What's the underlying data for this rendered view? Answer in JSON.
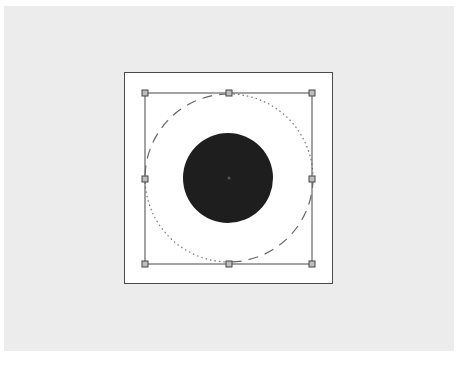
{
  "canvas": {
    "background_color": "#ececec",
    "page_border_color": "#4a4a4a"
  },
  "shapes": {
    "outer_circle": {
      "cx": 229,
      "cy": 178,
      "r": 84,
      "stroke": "#666666",
      "style": "dashed/dotted"
    },
    "filled_circle": {
      "cx": 228,
      "cy": 178,
      "r": 45,
      "fill": "#1e1e1e"
    }
  },
  "selection": {
    "x": 145,
    "y": 93,
    "width": 167,
    "height": 171,
    "stroke": "#666666",
    "handles": [
      "top-left",
      "top-center",
      "top-right",
      "middle-left",
      "middle-right",
      "bottom-left",
      "bottom-center",
      "bottom-right"
    ]
  }
}
